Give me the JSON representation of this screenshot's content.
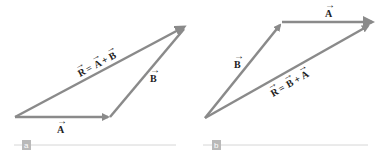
{
  "figure": {
    "panels": [
      {
        "id": "a",
        "tag": "a",
        "vectors": [
          {
            "name": "A",
            "label": "A",
            "from": [
              15,
              117
            ],
            "to": [
              110,
              117
            ]
          },
          {
            "name": "B",
            "label": "B",
            "from": [
              110,
              117
            ],
            "to": [
              187,
              25
            ]
          },
          {
            "name": "R",
            "label": "R = A + B",
            "from": [
              15,
              117
            ],
            "to": [
              187,
              25
            ]
          }
        ],
        "equation": {
          "R": "R",
          "eq": "=",
          "t1": "A",
          "plus": "+",
          "t2": "B"
        }
      },
      {
        "id": "b",
        "tag": "b",
        "vectors": [
          {
            "name": "B",
            "label": "B",
            "from": [
              205,
              118
            ],
            "to": [
              282,
              22
            ]
          },
          {
            "name": "A",
            "label": "A",
            "from": [
              282,
              22
            ],
            "to": [
              375,
              22
            ]
          },
          {
            "name": "R",
            "label": "R = B + A",
            "from": [
              205,
              118
            ],
            "to": [
              375,
              22
            ]
          }
        ],
        "equation": {
          "R": "R",
          "eq": "=",
          "t1": "B",
          "plus": "+",
          "t2": "A"
        }
      }
    ],
    "colors": {
      "vector": "#8a8a8a",
      "tag_bg": "#b9b9b9",
      "rule": "#d6d6d6",
      "text": "#222222"
    }
  }
}
